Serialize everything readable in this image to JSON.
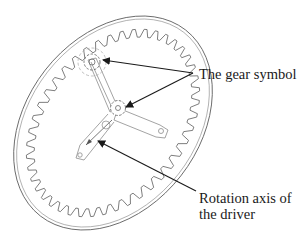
{
  "figure": {
    "labels": {
      "gear_symbol": "The gear symbol",
      "rotation_axis_line1": "Rotation axis of",
      "rotation_axis_line2": "the driver"
    },
    "colors": {
      "outline": "#6a6a6a",
      "arrow": "#1a1a1a",
      "background": "#ffffff"
    }
  }
}
